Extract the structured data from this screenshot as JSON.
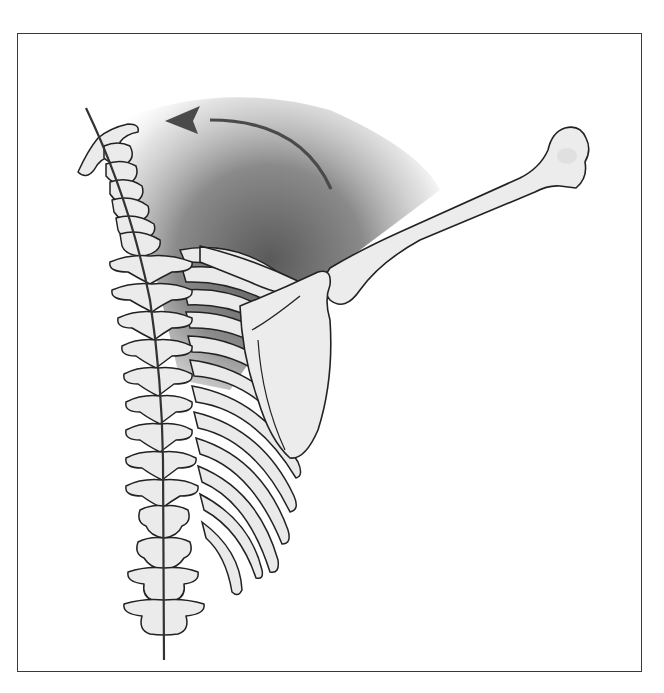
{
  "figure": {
    "type": "anatomical-illustration",
    "elements": [
      {
        "name": "spinal-column",
        "description": "cervical to lumbar vertebrae, slight lateral curve"
      },
      {
        "name": "spine-axis-line",
        "description": "thin dark line through vertebral bodies"
      },
      {
        "name": "rib-cage",
        "description": "right side ribs curving downward"
      },
      {
        "name": "scapula",
        "description": "shoulder blade"
      },
      {
        "name": "clavicle",
        "description": "collarbone to shoulder"
      },
      {
        "name": "humerus",
        "description": "arm bone raised diagonally up-right"
      },
      {
        "name": "motion-arrow",
        "description": "curved arrow pointing left toward head"
      },
      {
        "name": "shadow-gradient",
        "description": "grey radial shading behind upper ribs"
      }
    ],
    "colors": {
      "bone_fill": "#ececec",
      "outline": "#222222",
      "arrow": "#4a4a4a",
      "shadow_dark": "#6e6e6e",
      "frame_border": "#3a3a3a",
      "background": "#ffffff"
    }
  }
}
